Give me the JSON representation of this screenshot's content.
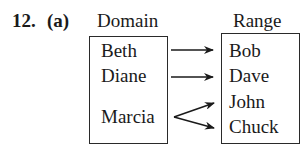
{
  "problem": {
    "number": "12.",
    "part": "(a)"
  },
  "domain": {
    "title": "Domain",
    "items": [
      "Beth",
      "Diane",
      "Marcia"
    ]
  },
  "range": {
    "title": "Range",
    "items": [
      "Bob",
      "Dave",
      "John",
      "Chuck"
    ]
  },
  "mapping": [
    {
      "from": "Beth",
      "to": "Bob"
    },
    {
      "from": "Diane",
      "to": "Dave"
    },
    {
      "from": "Marcia",
      "to": "John"
    },
    {
      "from": "Marcia",
      "to": "Chuck"
    }
  ]
}
